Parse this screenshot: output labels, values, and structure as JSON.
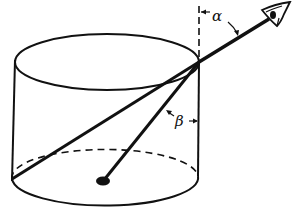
{
  "figure": {
    "labels": {
      "alpha": "α",
      "beta": "β"
    },
    "colors": {
      "ink": "#111111",
      "background": "#ffffff"
    },
    "elements": {
      "cylinder": "cylinder-vessel",
      "eye": "observer-eye",
      "incident_ray": "line-of-sight",
      "refracted_ray": "refracted-ray",
      "normal": "vertical-normal",
      "object": "object-dot"
    }
  }
}
